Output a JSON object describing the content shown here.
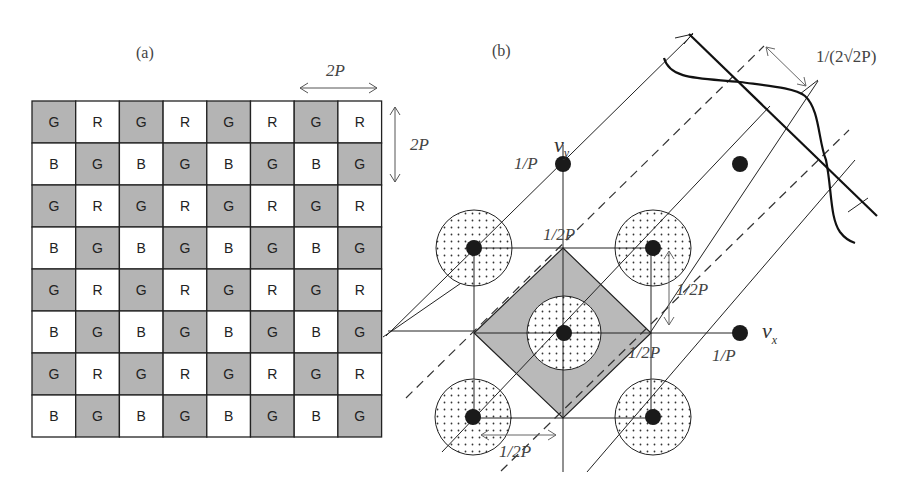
{
  "panel_a": {
    "label": "(a)",
    "grid_rows": [
      [
        "G",
        "R",
        "G",
        "R",
        "G",
        "R",
        "G",
        "R"
      ],
      [
        "B",
        "G",
        "B",
        "G",
        "B",
        "G",
        "B",
        "G"
      ],
      [
        "G",
        "R",
        "G",
        "R",
        "G",
        "R",
        "G",
        "R"
      ],
      [
        "B",
        "G",
        "B",
        "G",
        "B",
        "G",
        "B",
        "G"
      ],
      [
        "G",
        "R",
        "G",
        "R",
        "G",
        "R",
        "G",
        "R"
      ],
      [
        "B",
        "G",
        "B",
        "G",
        "B",
        "G",
        "B",
        "G"
      ],
      [
        "G",
        "R",
        "G",
        "R",
        "G",
        "R",
        "G",
        "R"
      ],
      [
        "B",
        "G",
        "B",
        "G",
        "B",
        "G",
        "B",
        "G"
      ]
    ],
    "horizontal_dim": "2P",
    "vertical_dim": "2P",
    "colors": {
      "green_cell": "#b4b4b4",
      "other_cell": "#ffffff",
      "grid_line": "#222222"
    }
  },
  "panel_b": {
    "label": "(b)",
    "axis_y": "ν",
    "axis_y_sub": "y",
    "axis_x": "ν",
    "axis_x_sub": "x",
    "label_1_over_P_y": "1/P",
    "label_1_over_P_x": "1/P",
    "label_half_top": "1/2P",
    "label_half_right": "1/2P",
    "label_half_diag": "1/2P",
    "label_half_bottom": "1/2P",
    "label_spacing": "1/(2√2P)",
    "colors": {
      "diamond_fill": "#b9b9b9",
      "dot": "#1a1a1a",
      "line": "#222222"
    }
  }
}
